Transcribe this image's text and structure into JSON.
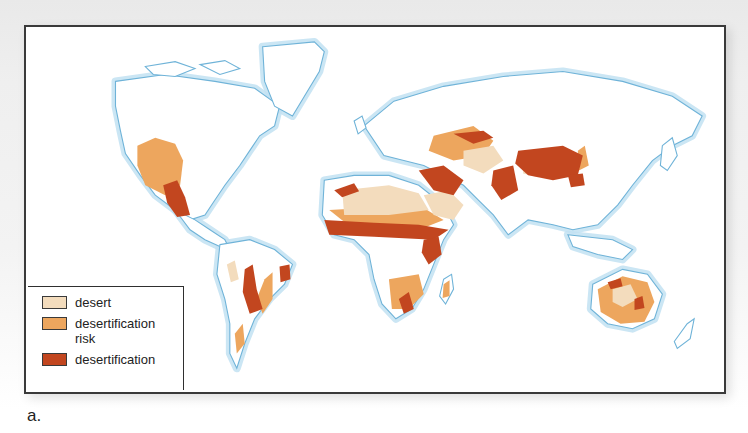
{
  "figure": {
    "caption": "a.",
    "type": "world map"
  },
  "colors": {
    "ocean": "#ffffff",
    "land": "#ffffff",
    "coastline": "#6fb3d8",
    "coast_glow": "#d6ecf8",
    "frame_border": "#3a3a3a",
    "desert": "#f3dcbd",
    "desertification_risk": "#eda65e",
    "desertification": "#c2461f"
  },
  "legend": {
    "items": [
      {
        "key": "desert",
        "label": "desert",
        "color": "#f3dcbd"
      },
      {
        "key": "desertification_risk",
        "label": "desertification risk",
        "color": "#eda65e"
      },
      {
        "key": "desertification",
        "label": "desertification",
        "color": "#c2461f"
      }
    ]
  },
  "regions": [
    {
      "name": "western-north-america",
      "categories": [
        "desertification_risk",
        "desertification",
        "desert"
      ]
    },
    {
      "name": "mexico",
      "categories": [
        "desertification",
        "desertification_risk"
      ]
    },
    {
      "name": "south-america-andes",
      "categories": [
        "desertification",
        "desertification_risk",
        "desert"
      ]
    },
    {
      "name": "northeast-brazil",
      "categories": [
        "desertification",
        "desertification_risk"
      ]
    },
    {
      "name": "sahara",
      "categories": [
        "desert",
        "desertification_risk",
        "desertification"
      ]
    },
    {
      "name": "sahel",
      "categories": [
        "desertification"
      ]
    },
    {
      "name": "horn-of-africa",
      "categories": [
        "desertification",
        "desertification_risk",
        "desert"
      ]
    },
    {
      "name": "southern-africa",
      "categories": [
        "desertification_risk",
        "desertification"
      ]
    },
    {
      "name": "madagascar",
      "categories": [
        "desertification_risk",
        "desertification"
      ]
    },
    {
      "name": "middle-east-arabia",
      "categories": [
        "desert",
        "desertification"
      ]
    },
    {
      "name": "central-asia",
      "categories": [
        "desertification",
        "desertification_risk",
        "desert"
      ]
    },
    {
      "name": "mongolia-north-china",
      "categories": [
        "desertification",
        "desert",
        "desertification_risk"
      ]
    },
    {
      "name": "australia",
      "categories": [
        "desertification_risk",
        "desert",
        "desertification"
      ]
    }
  ]
}
